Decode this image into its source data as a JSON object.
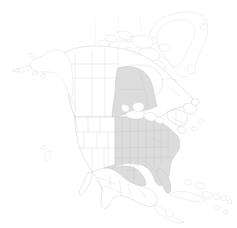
{
  "map": {
    "title": "North America",
    "projection": "conic",
    "background_color": "#ffffff",
    "outline_color": "#c9c9c9",
    "highlight_fill_color": "#dcdcdc",
    "highlight_stroke_color": "#c4c4c4",
    "subdivision_stroke_color": "#d2d2d2",
    "graticule_color": "#e6e6e6",
    "width": 237,
    "height": 228,
    "legend_visible": false,
    "labels_visible": false
  },
  "regions": [
    {
      "id": "greenland",
      "name": "Greenland",
      "highlighted": false,
      "fill": "#ffffff"
    },
    {
      "id": "canada",
      "name": "Canada",
      "highlighted": false,
      "fill": "#ffffff",
      "subdivisions_shown": true
    },
    {
      "id": "canada-ontario",
      "name": "Ontario",
      "highlighted": true,
      "fill": "#dcdcdc"
    },
    {
      "id": "alaska",
      "name": "Alaska",
      "highlighted": false,
      "fill": "#ffffff"
    },
    {
      "id": "united-states-west",
      "name": "Western United States",
      "highlighted": false,
      "fill": "#ffffff",
      "subdivisions_shown": true
    },
    {
      "id": "united-states-central-east",
      "name": "Central and Eastern United States",
      "highlighted": true,
      "fill": "#dcdcdc",
      "subdivisions_shown": true
    },
    {
      "id": "mexico",
      "name": "Mexico",
      "highlighted": false,
      "fill": "#ffffff",
      "subdivisions_shown": true
    },
    {
      "id": "central-america",
      "name": "Central America",
      "highlighted": false,
      "fill": "#ffffff"
    },
    {
      "id": "caribbean",
      "name": "Caribbean Islands",
      "highlighted": false,
      "fill": "#ffffff"
    }
  ],
  "features": {
    "great_lakes": "Great Lakes",
    "hudson_bay": "Hudson Bay",
    "baffin_island": "Baffin Island",
    "newfoundland": "Newfoundland",
    "cuba": "Cuba",
    "baja_california": "Baja California"
  }
}
